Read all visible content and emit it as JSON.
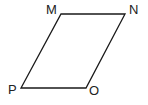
{
  "diagram": {
    "type": "parallelogram",
    "stroke_color": "#1a1a1a",
    "vertices": [
      {
        "name": "M",
        "x": 61,
        "y": 14
      },
      {
        "name": "N",
        "x": 125,
        "y": 14
      },
      {
        "name": "O",
        "x": 86,
        "y": 88
      },
      {
        "name": "P",
        "x": 21,
        "y": 88
      }
    ],
    "labels": {
      "M": "M",
      "N": "N",
      "O": "O",
      "P": "P"
    }
  }
}
